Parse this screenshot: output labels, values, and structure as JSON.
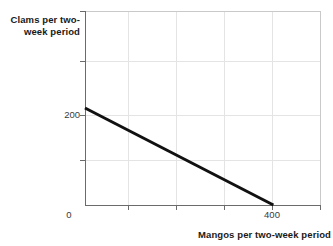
{
  "chart_data": {
    "type": "line",
    "title": "",
    "subtitle": "",
    "xlabel": "Mangos per two-week period",
    "ylabel": "Clams per two-week period",
    "xlim": [
      0,
      500
    ],
    "ylim": [
      0,
      400
    ],
    "grid": true,
    "legend": null,
    "x_tick_labels": [
      "0",
      "400"
    ],
    "y_tick_labels": [
      "200"
    ],
    "x_tick_values": [
      0,
      400
    ],
    "y_tick_values": [
      200
    ],
    "x_gridline_values": [
      100,
      200,
      300,
      400,
      500
    ],
    "y_gridline_values": [
      100,
      200,
      300,
      400
    ],
    "series": [
      {
        "name": "budget constraint",
        "x": [
          0,
          400
        ],
        "values": [
          200,
          0
        ],
        "color": "#111111",
        "linewidth": 3
      }
    ],
    "annotations": []
  },
  "axis_titles": {
    "y": "Clams per two-week period",
    "x": "Mangos per two-week period"
  },
  "ticks": {
    "y_200": "200",
    "x_0": "0",
    "x_400": "400"
  },
  "colors": {
    "line": "#111111",
    "axis": "#6b6b6b",
    "grid": "#e2e2e2",
    "background": "#ffffff",
    "text": "#1a1a1a"
  }
}
